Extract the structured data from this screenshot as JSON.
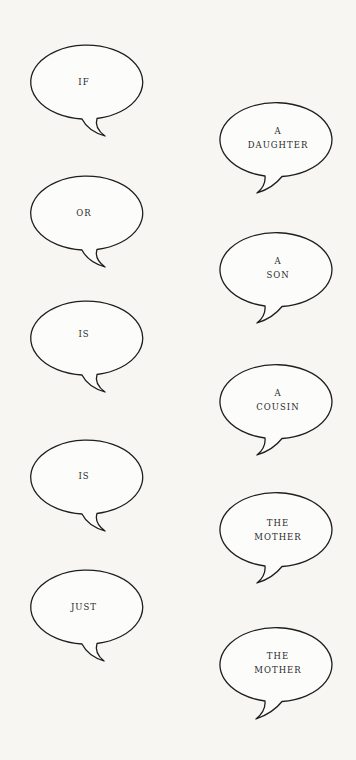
{
  "background_color": "#f7f6f3",
  "stroke_color": "#1e1e1e",
  "text_color": "#2a2a2a",
  "left_column": [
    {
      "lines": [
        "IF"
      ],
      "cx": 84,
      "cy": 82
    },
    {
      "lines": [
        "OR"
      ],
      "cx": 84,
      "cy": 213
    },
    {
      "lines": [
        "IS"
      ],
      "cx": 84,
      "cy": 338
    },
    {
      "lines": [
        "IS"
      ],
      "cx": 84,
      "cy": 477
    },
    {
      "lines": [
        "JUST"
      ],
      "cx": 84,
      "cy": 607
    }
  ],
  "right_column": [
    {
      "lines": [
        "A",
        "DAUGHTER"
      ],
      "cx": 278,
      "cy": 140
    },
    {
      "lines": [
        "A",
        "SON"
      ],
      "cx": 278,
      "cy": 270
    },
    {
      "lines": [
        "A",
        "COUSIN"
      ],
      "cx": 278,
      "cy": 402
    },
    {
      "lines": [
        "THE",
        "MOTHER"
      ],
      "cx": 278,
      "cy": 530
    },
    {
      "lines": [
        "THE",
        "MOTHER"
      ],
      "cx": 278,
      "cy": 665
    }
  ]
}
